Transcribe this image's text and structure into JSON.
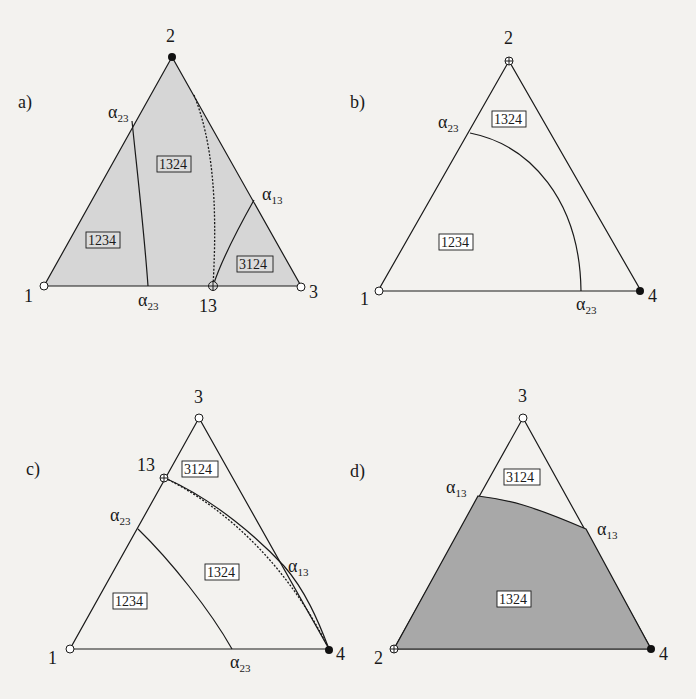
{
  "colors": {
    "background": "#f3f2ef",
    "shade_light": "#d6d6d6",
    "shade_dark": "#a8a8a8",
    "ink": "#1a1a1a"
  },
  "legend": {
    "open_circle": "open-vertex-marker",
    "filled_circle": "filled-vertex-marker",
    "crossed_circle": "crossed-vertex-marker"
  },
  "panels": {
    "a": {
      "label": "a)",
      "vertices": {
        "top": "2",
        "left": "1",
        "right": "3",
        "bottom_mid": "13"
      },
      "boundary_labels": {
        "left_edge": "α",
        "left_edge_sub": "23",
        "bottom": "α",
        "bottom_sub": "23",
        "right_edge": "α",
        "right_edge_sub": "13"
      },
      "regions": [
        "1234",
        "1324",
        "3124"
      ]
    },
    "b": {
      "label": "b)",
      "vertices": {
        "top": "2",
        "left": "1",
        "right": "4"
      },
      "boundary_labels": {
        "left_edge": "α",
        "left_edge_sub": "23",
        "bottom": "α",
        "bottom_sub": "23"
      },
      "regions": [
        "1324",
        "1234"
      ]
    },
    "c": {
      "label": "c)",
      "vertices": {
        "top": "3",
        "left": "1",
        "right": "4",
        "left_edge_point": "13"
      },
      "boundary_labels": {
        "left_edge": "α",
        "left_edge_sub": "23",
        "bottom": "α",
        "bottom_sub": "23",
        "right_edge": "α",
        "right_edge_sub": "13"
      },
      "regions": [
        "3124",
        "1324",
        "1234"
      ]
    },
    "d": {
      "label": "d)",
      "vertices": {
        "top": "3",
        "left": "2",
        "right": "4"
      },
      "boundary_labels": {
        "left_edge": "α",
        "left_edge_sub": "13",
        "right_edge": "α",
        "right_edge_sub": "13"
      },
      "regions": [
        "3124",
        "1324"
      ]
    }
  }
}
